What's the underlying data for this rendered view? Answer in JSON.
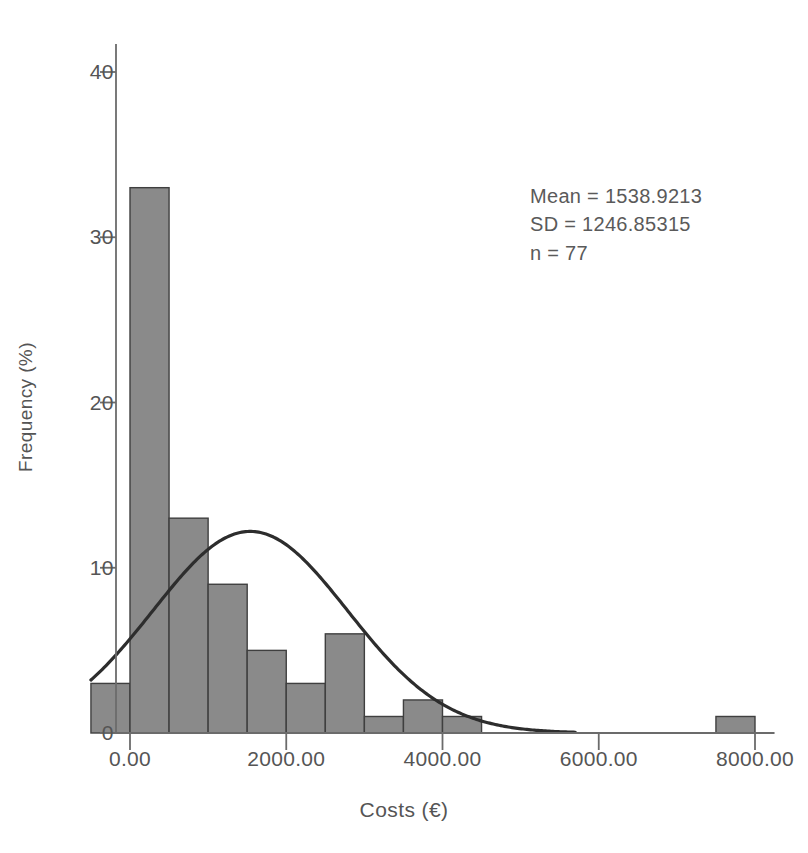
{
  "chart_data": {
    "type": "bar",
    "subtype": "histogram",
    "title": "",
    "xlabel": "Costs (€)",
    "ylabel": "Frequency (%)",
    "xlim": [
      -500,
      8250
    ],
    "ylim": [
      0,
      42
    ],
    "grid": false,
    "legend": false,
    "bin_width": 500,
    "bin_starts": [
      -500,
      0,
      500,
      1000,
      1500,
      2000,
      2500,
      3000,
      3500,
      4000,
      4500,
      7500
    ],
    "categories": [
      "-500",
      "0",
      "500",
      "1000",
      "1500",
      "2000",
      "2500",
      "3000",
      "3500",
      "4000",
      "4500",
      "7500"
    ],
    "values": [
      3,
      33,
      13,
      9,
      5,
      3,
      6,
      1,
      2,
      1,
      0,
      1
    ],
    "x_ticks": [
      0,
      2000,
      4000,
      6000,
      8000
    ],
    "x_tick_labels": [
      "0.00",
      "2000.00",
      "4000.00",
      "6000.00",
      "8000.00"
    ],
    "y_ticks": [
      0,
      10,
      20,
      30,
      40
    ],
    "y_tick_labels": [
      "0",
      "10",
      "20",
      "30",
      "40"
    ],
    "bar_color": "#8a8a8a",
    "bar_edge_color": "#3f3f3f",
    "curve_color": "#2d2d2d",
    "axis_color": "#6b6b6b",
    "normal_curve": {
      "shown": true,
      "mean": 1538.9213,
      "sd": 1246.85315,
      "peak_percent": 12.2,
      "left_edge_percent": 6.1,
      "x_start": -500,
      "x_end": 5700
    },
    "annotations": {
      "mean_label": "Mean = 1538.9213",
      "sd_label": "SD = 1246.85315",
      "n_label": "n = 77"
    }
  },
  "statistics": {
    "mean_label": "Mean = 1538.9213",
    "sd_label": "SD = 1246.85315",
    "n_label": "n = 77"
  },
  "axes": {
    "x_title": "Costs (€)",
    "y_title": "Frequency (%)",
    "y_tick_0": "0",
    "y_tick_10": "10",
    "y_tick_20": "20",
    "y_tick_30": "30",
    "y_tick_40": "40",
    "x_tick_0": "0.00",
    "x_tick_2000": "2000.00",
    "x_tick_4000": "4000.00",
    "x_tick_6000": "6000.00",
    "x_tick_8000": "8000.00"
  }
}
